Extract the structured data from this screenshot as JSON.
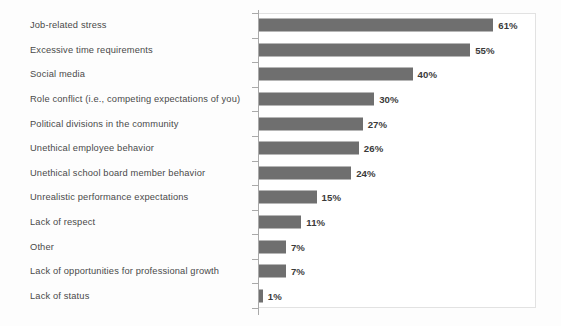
{
  "chart_data": {
    "type": "bar",
    "orientation": "horizontal",
    "title": "",
    "subtitle": "",
    "xlabel": "",
    "ylabel": "",
    "xlim": [
      0,
      72
    ],
    "grid": false,
    "legend": false,
    "bar_color": "#6f6f6f",
    "axis_color": "#a9a9a9",
    "plot_border_color": "#e2e2e2",
    "label_color": "#4a4a4a",
    "value_label_color": "#3a3a3a",
    "value_suffix": "%",
    "categories": [
      "Job-related stress",
      "Excessive time requirements",
      "Social media",
      "Role conflict (i.e., competing expectations of you)",
      "Political divisions in the community",
      "Unethical employee behavior",
      "Unethical school board member behavior",
      "Unrealistic performance expectations",
      "Lack of respect",
      "Other",
      "Lack of opportunities for professional growth",
      "Lack of status"
    ],
    "values": [
      61,
      55,
      40,
      30,
      27,
      26,
      24,
      15,
      11,
      7,
      7,
      1
    ],
    "value_labels": [
      "61%",
      "55%",
      "40%",
      "30%",
      "27%",
      "26%",
      "24%",
      "15%",
      "11%",
      "7%",
      "7%",
      "1%"
    ]
  }
}
